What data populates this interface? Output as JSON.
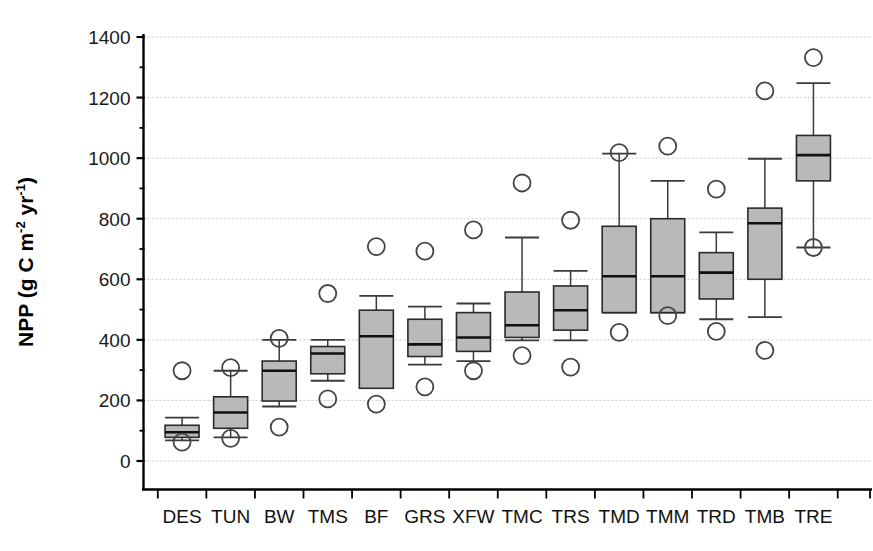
{
  "chart_data": {
    "type": "box",
    "title": "",
    "xlabel": "",
    "ylabel": "NPP (g C m−2 yr−1)",
    "ylabel_parts": {
      "prefix": "NPP (g C m",
      "sup1": "-2",
      "mid": " yr",
      "sup2": "-1",
      "suffix": ")"
    },
    "ylim": [
      0,
      1400
    ],
    "yticks": [
      0,
      200,
      400,
      600,
      800,
      1000,
      1200,
      1400
    ],
    "ytick_labels": [
      "0",
      "200",
      "400",
      "600",
      "800",
      "1000",
      "1200",
      "1400"
    ],
    "grid": true,
    "grid_axis": "y",
    "legend": "none",
    "categories": [
      "DES",
      "TUN",
      "BW",
      "TMS",
      "BF",
      "GRS",
      "XFW",
      "TMC",
      "TRS",
      "TMD",
      "TMM",
      "TRD",
      "TMB",
      "TRE"
    ],
    "boxes": [
      {
        "category": "DES",
        "whisker_low": 68,
        "q1": 78,
        "median": 95,
        "q3": 118,
        "whisker_high": 143,
        "outliers": [
          298,
          62
        ]
      },
      {
        "category": "TUN",
        "whisker_low": 78,
        "q1": 108,
        "median": 160,
        "q3": 212,
        "whisker_high": 298,
        "outliers": [
          308,
          75
        ]
      },
      {
        "category": "BW",
        "whisker_low": 180,
        "q1": 198,
        "median": 298,
        "q3": 330,
        "whisker_high": 400,
        "outliers": [
          405,
          112
        ]
      },
      {
        "category": "TMS",
        "whisker_low": 265,
        "q1": 288,
        "median": 355,
        "q3": 378,
        "whisker_high": 400,
        "outliers": [
          553,
          205
        ]
      },
      {
        "category": "BF",
        "whisker_low": 262,
        "q1": 240,
        "median": 412,
        "q3": 498,
        "whisker_high": 545,
        "outliers": [
          708,
          188
        ]
      },
      {
        "category": "GRS",
        "whisker_low": 318,
        "q1": 345,
        "median": 385,
        "q3": 468,
        "whisker_high": 510,
        "outliers": [
          693,
          245
        ]
      },
      {
        "category": "XFW",
        "whisker_low": 330,
        "q1": 362,
        "median": 408,
        "q3": 490,
        "whisker_high": 520,
        "outliers": [
          763,
          298
        ]
      },
      {
        "category": "TMC",
        "whisker_low": 398,
        "q1": 408,
        "median": 448,
        "q3": 558,
        "whisker_high": 738,
        "outliers": [
          918,
          348
        ]
      },
      {
        "category": "TRS",
        "whisker_low": 398,
        "q1": 432,
        "median": 498,
        "q3": 578,
        "whisker_high": 628,
        "outliers": [
          795,
          310
        ]
      },
      {
        "category": "TMD",
        "whisker_low": 490,
        "q1": 490,
        "median": 610,
        "q3": 775,
        "whisker_high": 1015,
        "outliers": [
          1018,
          425
        ]
      },
      {
        "category": "TMM",
        "whisker_low": 490,
        "q1": 490,
        "median": 610,
        "q3": 800,
        "whisker_high": 925,
        "outliers": [
          1040,
          480
        ]
      },
      {
        "category": "TRD",
        "whisker_low": 468,
        "q1": 535,
        "median": 622,
        "q3": 688,
        "whisker_high": 755,
        "outliers": [
          898,
          428
        ]
      },
      {
        "category": "TMB",
        "whisker_low": 475,
        "q1": 600,
        "median": 785,
        "q3": 835,
        "whisker_high": 998,
        "outliers": [
          1222,
          365
        ]
      },
      {
        "category": "TRE",
        "whisker_low": 705,
        "q1": 925,
        "median": 1010,
        "q3": 1075,
        "whisker_high": 1248,
        "outliers": [
          1332,
          705
        ]
      }
    ]
  },
  "style": {
    "box_fill": "#b9b9b9",
    "box_stroke": "#2b2b2b",
    "median_color": "#111111",
    "grid_color": "#c9c9c9",
    "axis_color": "#000000",
    "outlier_stroke": "#444444",
    "background": "#ffffff"
  }
}
